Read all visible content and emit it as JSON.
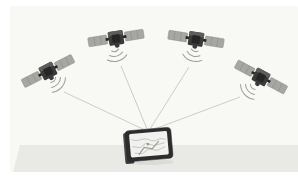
{
  "scene": {
    "elements": [
      "gps-satellite",
      "signal-arcs",
      "signal-beam",
      "gps-navigation-device",
      "ground-surface"
    ],
    "colors": {
      "page_bg": "#ffffff",
      "backdrop": "#f8f8f5",
      "ground": "#e9e9e5",
      "panel": "#a6a6a2",
      "panel_edge": "#8d8d89",
      "body": "#3a3a3a",
      "body_top": "#5d5d5a",
      "body_dark": "#262626",
      "arc": "#9c9c98",
      "beam": "#c6c6c2",
      "device_frame": "#2d2d2d",
      "device_edge": "#4a4a4a",
      "screen": "#f1f1ee",
      "map_line": "#bcbcb7",
      "map_route": "#9a9a95",
      "shadow": "rgba(0,0,0,0.06)"
    },
    "satellites": [
      {
        "transform": "translate(48,71) rotate(-27)",
        "arcs_transform": "translate(50,77) rotate(-48)"
      },
      {
        "transform": "translate(116,38) rotate(-9)",
        "arcs_transform": "translate(114,46) rotate(-15)"
      },
      {
        "transform": "translate(196,39) rotate(9)",
        "arcs_transform": "translate(196,46) rotate(18)"
      },
      {
        "transform": "translate(261,77) rotate(28)",
        "arcs_transform": "translate(256,84) rotate(48)"
      }
    ],
    "beams": [
      {
        "x1": 64,
        "y1": 92,
        "x2": 145,
        "y2": 130
      },
      {
        "x1": 121,
        "y1": 66,
        "x2": 147,
        "y2": 129
      },
      {
        "x1": 189,
        "y1": 67,
        "x2": 150,
        "y2": 129
      },
      {
        "x1": 240,
        "y1": 97,
        "x2": 152,
        "y2": 130
      }
    ],
    "device": {
      "transform": "translate(149,145) rotate(-5)"
    }
  }
}
